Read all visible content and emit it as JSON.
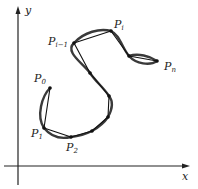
{
  "figure": {
    "axes": {
      "x_label": "x",
      "y_label": "y"
    },
    "points": [
      {
        "name": "P0",
        "base": "P",
        "sub": "0",
        "x": 50,
        "y": 88,
        "label_x": 34,
        "label_y": 82
      },
      {
        "name": "P1",
        "base": "P",
        "sub": "1",
        "x": 44,
        "y": 128,
        "label_x": 31,
        "label_y": 137
      },
      {
        "name": "P2",
        "base": "P",
        "sub": "2",
        "x": 71,
        "y": 137,
        "label_x": 66,
        "label_y": 151
      },
      {
        "name": "",
        "base": "",
        "sub": "",
        "x": 92,
        "y": 131
      },
      {
        "name": "",
        "base": "",
        "sub": "",
        "x": 108,
        "y": 117
      },
      {
        "name": "",
        "base": "",
        "sub": "",
        "x": 109,
        "y": 96
      },
      {
        "name": "",
        "base": "",
        "sub": "",
        "x": 90,
        "y": 73
      },
      {
        "name": "Pi-1",
        "base": "P",
        "sub": "i−1",
        "x": 74,
        "y": 43,
        "label_x": 48,
        "label_y": 45
      },
      {
        "name": "Pi",
        "base": "P",
        "sub": "i",
        "x": 111,
        "y": 31,
        "label_x": 114,
        "label_y": 29
      },
      {
        "name": "",
        "base": "",
        "sub": "",
        "x": 129,
        "y": 56
      },
      {
        "name": "Pn",
        "base": "P",
        "sub": "n",
        "x": 157,
        "y": 61,
        "label_x": 165,
        "label_y": 69
      }
    ],
    "colors": {
      "curve": "#3a3a3a",
      "polygon": "#111111",
      "axes": "#222222",
      "background": "#ffffff"
    }
  }
}
